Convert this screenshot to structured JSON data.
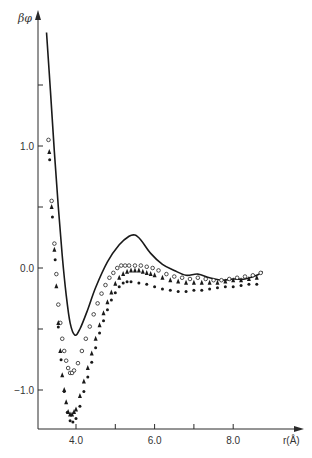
{
  "chart_data": {
    "type": "line",
    "title": "",
    "xlabel": "r(Å)",
    "ylabel": "βφ",
    "xlim": [
      3.0,
      9.2
    ],
    "ylim": [
      -1.4,
      2.0
    ],
    "x_ticks": [
      4.0,
      5.0,
      6.0,
      7.0,
      8.0
    ],
    "x_tick_labels": [
      "4.0",
      "",
      "6.0",
      "",
      "8.0"
    ],
    "y_ticks": [
      1.5,
      1.0,
      0.5,
      0.0,
      -0.5,
      -1.0
    ],
    "y_tick_labels": [
      "",
      "1.0",
      "",
      "0.0",
      "",
      "−1.0"
    ],
    "grid": false,
    "series": [
      {
        "name": "potential (solid curve)",
        "style": "line",
        "x": [
          3.25,
          3.35,
          3.45,
          3.55,
          3.65,
          3.75,
          3.85,
          3.97,
          4.1,
          4.3,
          4.5,
          4.8,
          5.1,
          5.35,
          5.5,
          5.65,
          5.9,
          6.2,
          6.5,
          6.8,
          7.1,
          7.4,
          7.7,
          8.0,
          8.3,
          8.6,
          8.75
        ],
        "y": [
          1.93,
          1.45,
          0.95,
          0.5,
          0.1,
          -0.22,
          -0.45,
          -0.55,
          -0.5,
          -0.34,
          -0.16,
          0.05,
          0.19,
          0.26,
          0.27,
          0.23,
          0.12,
          0.03,
          -0.02,
          -0.06,
          -0.05,
          -0.08,
          -0.1,
          -0.09,
          -0.09,
          -0.06,
          -0.03
        ]
      },
      {
        "name": "open circles",
        "style": "marker-open-circle",
        "x": [
          3.3,
          3.38,
          3.45,
          3.5,
          3.55,
          3.6,
          3.65,
          3.7,
          3.75,
          3.8,
          3.85,
          3.9,
          3.95,
          4.05,
          4.15,
          4.25,
          4.35,
          4.45,
          4.55,
          4.65,
          4.75,
          4.85,
          4.95,
          5.05,
          5.15,
          5.25,
          5.35,
          5.5,
          5.65,
          5.8,
          5.95,
          6.1,
          6.3,
          6.5,
          6.7,
          6.9,
          7.1,
          7.3,
          7.5,
          7.7,
          7.9,
          8.1,
          8.3,
          8.5,
          8.7
        ],
        "y": [
          1.05,
          0.55,
          0.2,
          -0.05,
          -0.3,
          -0.45,
          -0.58,
          -0.68,
          -0.76,
          -0.82,
          -0.86,
          -0.86,
          -0.84,
          -0.78,
          -0.68,
          -0.58,
          -0.48,
          -0.38,
          -0.29,
          -0.21,
          -0.14,
          -0.08,
          -0.04,
          0.0,
          0.02,
          0.02,
          0.02,
          0.02,
          0.02,
          0.01,
          0.0,
          -0.02,
          -0.05,
          -0.07,
          -0.08,
          -0.09,
          -0.08,
          -0.09,
          -0.1,
          -0.1,
          -0.09,
          -0.08,
          -0.07,
          -0.06,
          -0.04
        ]
      },
      {
        "name": "filled triangles",
        "style": "marker-filled-triangle",
        "x": [
          3.32,
          3.38,
          3.45,
          3.5,
          3.55,
          3.6,
          3.65,
          3.7,
          3.75,
          3.8,
          3.85,
          3.9,
          3.95,
          4.0,
          4.1,
          4.2,
          4.3,
          4.4,
          4.5,
          4.6,
          4.7,
          4.8,
          4.9,
          5.0,
          5.1,
          5.2,
          5.3,
          5.4,
          5.5,
          5.6,
          5.7,
          5.8,
          5.9,
          6.0,
          6.2,
          6.4,
          6.6,
          6.8,
          7.0,
          7.2,
          7.4,
          7.6,
          7.8,
          8.0,
          8.2,
          8.4,
          8.6
        ],
        "y": [
          0.95,
          0.5,
          0.15,
          -0.15,
          -0.45,
          -0.68,
          -0.88,
          -1.0,
          -1.1,
          -1.18,
          -1.2,
          -1.2,
          -1.18,
          -1.16,
          -1.05,
          -0.93,
          -0.82,
          -0.7,
          -0.58,
          -0.47,
          -0.37,
          -0.28,
          -0.2,
          -0.13,
          -0.08,
          -0.05,
          -0.03,
          -0.02,
          -0.02,
          -0.02,
          -0.03,
          -0.04,
          -0.05,
          -0.06,
          -0.08,
          -0.1,
          -0.11,
          -0.12,
          -0.12,
          -0.12,
          -0.12,
          -0.12,
          -0.11,
          -0.1,
          -0.1,
          -0.09,
          -0.08
        ]
      },
      {
        "name": "filled circles",
        "style": "marker-filled-circle",
        "x": [
          3.33,
          3.4,
          3.47,
          3.55,
          3.62,
          3.7,
          3.78,
          3.85,
          3.92,
          4.0,
          4.1,
          4.2,
          4.3,
          4.4,
          4.5,
          4.6,
          4.7,
          4.8,
          4.9,
          5.0,
          5.1,
          5.2,
          5.3,
          5.4,
          5.6,
          5.8,
          6.0,
          6.2,
          6.4,
          6.6,
          6.8,
          7.0,
          7.2,
          7.4,
          7.6,
          7.8,
          8.0,
          8.2,
          8.4,
          8.6
        ],
        "y": [
          0.92,
          0.45,
          0.1,
          -0.45,
          -0.72,
          -0.98,
          -1.15,
          -1.22,
          -1.23,
          -1.2,
          -1.1,
          -0.98,
          -0.86,
          -0.74,
          -0.62,
          -0.5,
          -0.4,
          -0.31,
          -0.23,
          -0.17,
          -0.12,
          -0.09,
          -0.08,
          -0.08,
          -0.09,
          -0.1,
          -0.12,
          -0.14,
          -0.15,
          -0.16,
          -0.16,
          -0.15,
          -0.15,
          -0.14,
          -0.13,
          -0.12,
          -0.12,
          -0.11,
          -0.1,
          -0.1
        ]
      }
    ]
  },
  "axes": {
    "ylabel": "βφ",
    "xlabel": "r(Å)"
  }
}
